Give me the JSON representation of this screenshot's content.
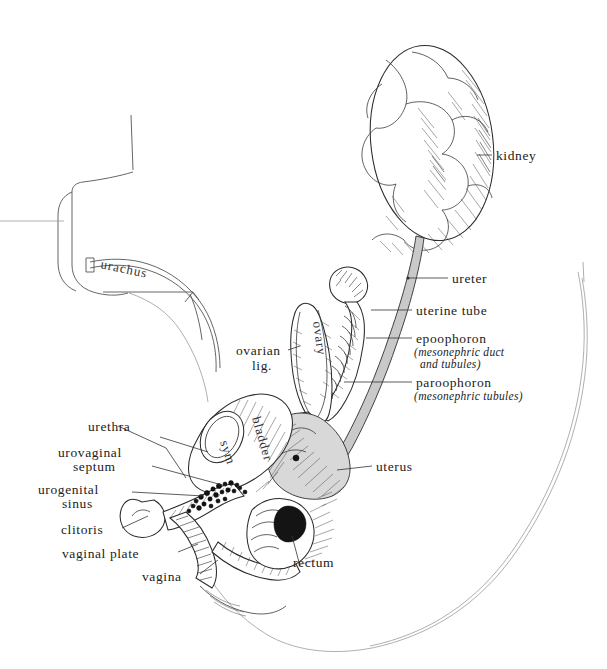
{
  "figure": {
    "style": "pen-and-ink anatomical illustration",
    "background_color": "#ffffff",
    "ink_color": "#222222",
    "tube_fill_color": "#c9c9c9"
  },
  "labels": {
    "kidney": "kidney",
    "ureter": "ureter",
    "uterine_tube": "uterine tube",
    "epoophoron": "epoophoron",
    "epoophoron_sub_1": "(mesonephric duct",
    "epoophoron_sub_2": "and tubules)",
    "paroophoron": "paroophoron",
    "paroophoron_sub": "(mesonephric tubules)",
    "uterus": "uterus",
    "rectum": "rectum",
    "ovarian_lig": "ovarian",
    "ovarian_lig_2": "lig.",
    "urachus": "urachus",
    "urethra": "urethra",
    "urovaginal": "urovaginal",
    "septum": "septum",
    "urogenital": "urogenital",
    "sinus": "sinus",
    "clitoris": "clitoris",
    "vaginal_plate": "vaginal plate",
    "vagina": "vagina"
  },
  "inline_labels": {
    "ovary": "ovary",
    "bladder": "bladder",
    "sym": "sym"
  }
}
